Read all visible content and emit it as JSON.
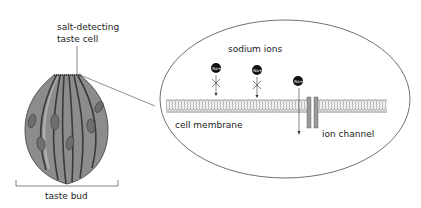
{
  "diagram": {
    "labels": {
      "taste_cell_line1": "salt-detecting",
      "taste_cell_line2": "taste cell",
      "taste_bud": "taste bud",
      "sodium_ions": "sodium ions",
      "cell_membrane": "cell membrane",
      "ion_channel": "ion channel"
    },
    "ions": [
      {
        "symbol": "Na+",
        "blocked": true
      },
      {
        "symbol": "Na+",
        "blocked": true
      },
      {
        "symbol": "Na+",
        "blocked": false
      }
    ],
    "colors": {
      "bud_fill": "#8c8c8c",
      "bud_stroke": "#3a3a3a",
      "nucleus": "#6e6e6e",
      "ion_fill": "#111111",
      "channel": "#9a9a9a",
      "line": "#333333"
    }
  }
}
